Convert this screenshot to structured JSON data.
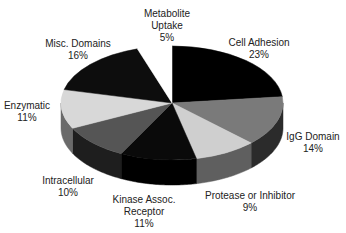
{
  "chart_data": {
    "type": "pie",
    "style": "3d-exploded-none",
    "title": "",
    "start_angle_deg": 90,
    "direction": "clockwise",
    "categories": [
      "Cell Adhesion",
      "IgG Domain",
      "Protease or Inhibitor",
      "Kinase Assoc. Receptor",
      "Intracellular",
      "Enzymatic",
      "Misc. Domains",
      "Metabolite Uptake"
    ],
    "values": [
      23,
      14,
      9,
      11,
      10,
      11,
      16,
      5
    ],
    "unit": "%",
    "colors": [
      "#000000",
      "#7a7a7a",
      "#cfcfcf",
      "#0a0a0a",
      "#555555",
      "#d8d8d8",
      "#0d0d0d",
      "#ffffff"
    ],
    "side_colors": [
      "#000000",
      "#2b2b2b",
      "#5f5f5f",
      "#000000",
      "#1e1e1e",
      "#6a6a6a",
      "#000000",
      "#bbbbbb"
    ],
    "legend": "none (data labels)"
  },
  "labels": [
    {
      "lines": [
        "Cell Adhesion",
        "23%"
      ],
      "x": 259,
      "y": 37
    },
    {
      "lines": [
        "IgG Domain",
        "14%"
      ],
      "x": 313,
      "y": 131
    },
    {
      "lines": [
        "Protease or Inhibitor",
        "9%"
      ],
      "x": 250,
      "y": 190
    },
    {
      "lines": [
        "Kinase Assoc.",
        "Receptor",
        "11%"
      ],
      "x": 144,
      "y": 194
    },
    {
      "lines": [
        "Intracellular",
        "10%"
      ],
      "x": 68,
      "y": 175
    },
    {
      "lines": [
        "Enzymatic",
        "11%"
      ],
      "x": 27,
      "y": 100
    },
    {
      "lines": [
        "Misc. Domains",
        "16%"
      ],
      "x": 78,
      "y": 38
    },
    {
      "lines": [
        "Metabolite",
        "Uptake",
        "5%"
      ],
      "x": 167,
      "y": 8
    }
  ]
}
